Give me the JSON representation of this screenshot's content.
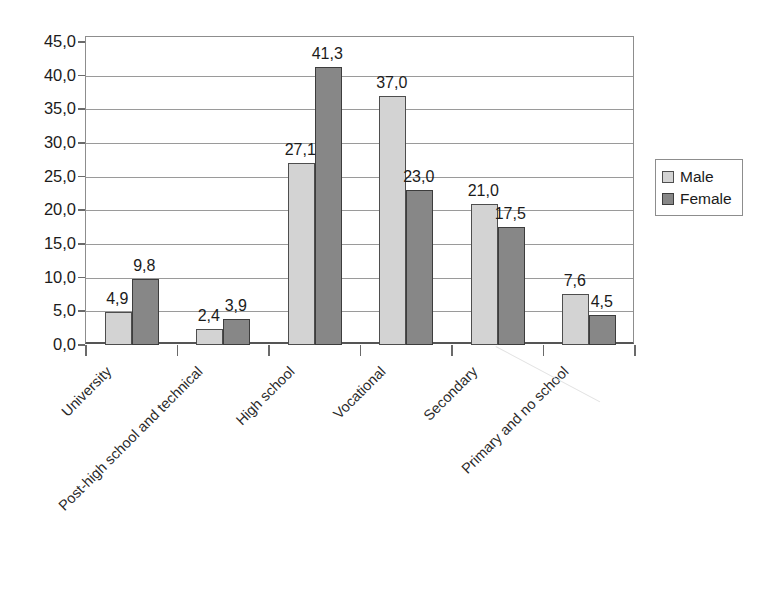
{
  "chart_data": {
    "type": "bar",
    "title": "",
    "subtitle": "",
    "xlabel": "",
    "ylabel": "",
    "categories": [
      "University",
      "Post-high school and technical",
      "High school",
      "Vocational",
      "Secondary",
      "Primary and no school"
    ],
    "series": [
      {
        "name": "Male",
        "color": "#d3d3d3",
        "values": [
          4.9,
          2.4,
          27.1,
          37.0,
          21.0,
          7.6
        ],
        "labels": [
          "4,9",
          "2,4",
          "27,1",
          "37,0",
          "21,0",
          "7,6"
        ]
      },
      {
        "name": "Female",
        "color": "#878787",
        "values": [
          9.8,
          3.9,
          41.3,
          23.0,
          17.5,
          4.5
        ],
        "labels": [
          "9,8",
          "3,9",
          "41,3",
          "23,0",
          "17,5",
          "4,5"
        ]
      }
    ],
    "ylim": [
      0,
      45
    ],
    "ytick_step": 5,
    "ytick_labels": [
      "0,0",
      "5,0",
      "10,0",
      "15,0",
      "20,0",
      "25,0",
      "30,0",
      "35,0",
      "40,0",
      "45,0"
    ],
    "ytick_values": [
      0,
      5,
      10,
      15,
      20,
      25,
      30,
      35,
      40,
      45
    ],
    "decimal_separator": ",",
    "grid": true,
    "grid_axis": "y",
    "legend_position": "right",
    "legend_entries": [
      "Male",
      "Female"
    ],
    "data_labels_shown": true,
    "category_label_rotation": -45
  }
}
